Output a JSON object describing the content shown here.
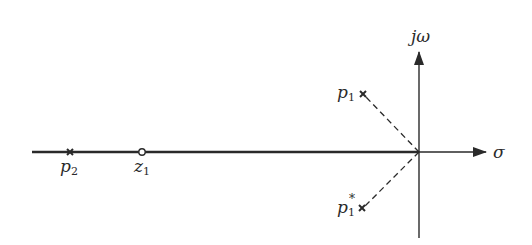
{
  "diagram": {
    "type": "s-plane pole-zero plot",
    "axes": {
      "real_label": "σ",
      "imag_label": "jω"
    },
    "poles": [
      {
        "name": "p",
        "subscript": "1",
        "superscript": "",
        "marker": "cross"
      },
      {
        "name": "p",
        "subscript": "1",
        "superscript": "*",
        "marker": "cross"
      },
      {
        "name": "p",
        "subscript": "2",
        "superscript": "",
        "marker": "cross"
      }
    ],
    "zeros": [
      {
        "name": "z",
        "subscript": "1",
        "marker": "circle"
      }
    ],
    "lines": {
      "dashed_from_origin_to": [
        "p1",
        "p1*"
      ],
      "bold_real_axis_segment": "from left edge to origin"
    },
    "colors": {
      "ink": "#2a2a2a",
      "background": "#ffffff"
    }
  }
}
